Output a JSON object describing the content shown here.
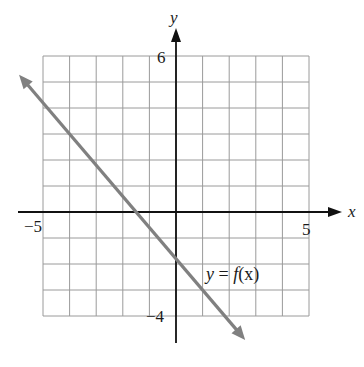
{
  "chart_data": {
    "type": "line",
    "title": "",
    "xlabel": "x",
    "ylabel": "y",
    "xlim": [
      -5,
      5
    ],
    "ylim": [
      -4,
      6
    ],
    "grid": true,
    "grid_step": 1,
    "tick_labels": {
      "x": [
        {
          "value": -5,
          "label": "−5"
        },
        {
          "value": 5,
          "label": "5"
        }
      ],
      "y": [
        {
          "value": 6,
          "label": "6"
        },
        {
          "value": -4,
          "label": "−4"
        }
      ]
    },
    "series": [
      {
        "name": "y = f(x)",
        "equation": "y = -1.2x - 1.8",
        "slope": -1.2,
        "intercept": -1.8,
        "x": [
          -5.9,
          -4,
          1,
          2.6
        ],
        "y": [
          5.28,
          3,
          -3,
          -4.92
        ],
        "arrows_both_ends": true,
        "color": "#808080"
      }
    ],
    "annotations": [
      {
        "text": "y = f(x)",
        "x": 1.2,
        "y": -2.6
      }
    ],
    "legend": "none"
  },
  "labels": {
    "x_axis": "x",
    "y_axis": "y",
    "x_min": "−5",
    "x_max": "5",
    "y_max": "6",
    "y_min": "−4",
    "curve_label_y": "y",
    "curve_label_eq": " = ",
    "curve_label_f": "f",
    "curve_label_arg": "(x)"
  },
  "colors": {
    "grid": "#9a9a9a",
    "axis": "#111111",
    "curve": "#808080",
    "text": "#1a1a1a"
  }
}
